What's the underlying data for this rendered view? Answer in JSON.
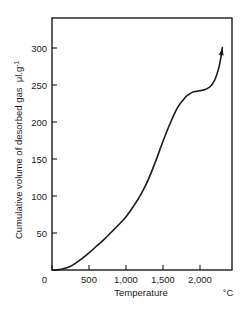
{
  "chart_data": {
    "type": "line",
    "title": "",
    "xlabel": "Temperature",
    "xunit": "°C",
    "ylabel": "Cumulative volume of desorbed gas",
    "yunit_base": "μl.g",
    "yunit_exp": "-1",
    "xlim": [
      0,
      2430
    ],
    "ylim": [
      0,
      340
    ],
    "xticks": [
      0,
      500,
      1000,
      1500,
      2000
    ],
    "xticklabels": [
      "0",
      "500",
      "1,000",
      "1,500",
      "2,000"
    ],
    "yticks": [
      0,
      50,
      100,
      150,
      200,
      250,
      300
    ],
    "yticklabels": [
      "0",
      "50",
      "100",
      "150",
      "200",
      "250",
      "300"
    ],
    "grid": false,
    "legend": null,
    "line_color": "#1a1a1a",
    "line_width": 1.6,
    "arrow_at_end": true,
    "series": [
      {
        "name": "Cumulative desorbed gas",
        "x": [
          0,
          100,
          150,
          200,
          250,
          300,
          400,
          500,
          600,
          700,
          800,
          900,
          1000,
          1100,
          1200,
          1300,
          1400,
          1500,
          1600,
          1700,
          1800,
          1850,
          1900,
          1950,
          2000,
          2050,
          2100,
          2150,
          2200,
          2250,
          2280,
          2300
        ],
        "y": [
          0,
          0.5,
          1.5,
          3,
          5,
          8,
          15,
          23,
          32,
          41,
          51,
          61,
          72,
          86,
          102,
          122,
          147,
          174,
          199,
          220,
          233,
          237,
          240,
          241,
          242,
          243,
          245,
          249,
          257,
          272,
          287,
          300
        ]
      }
    ]
  }
}
